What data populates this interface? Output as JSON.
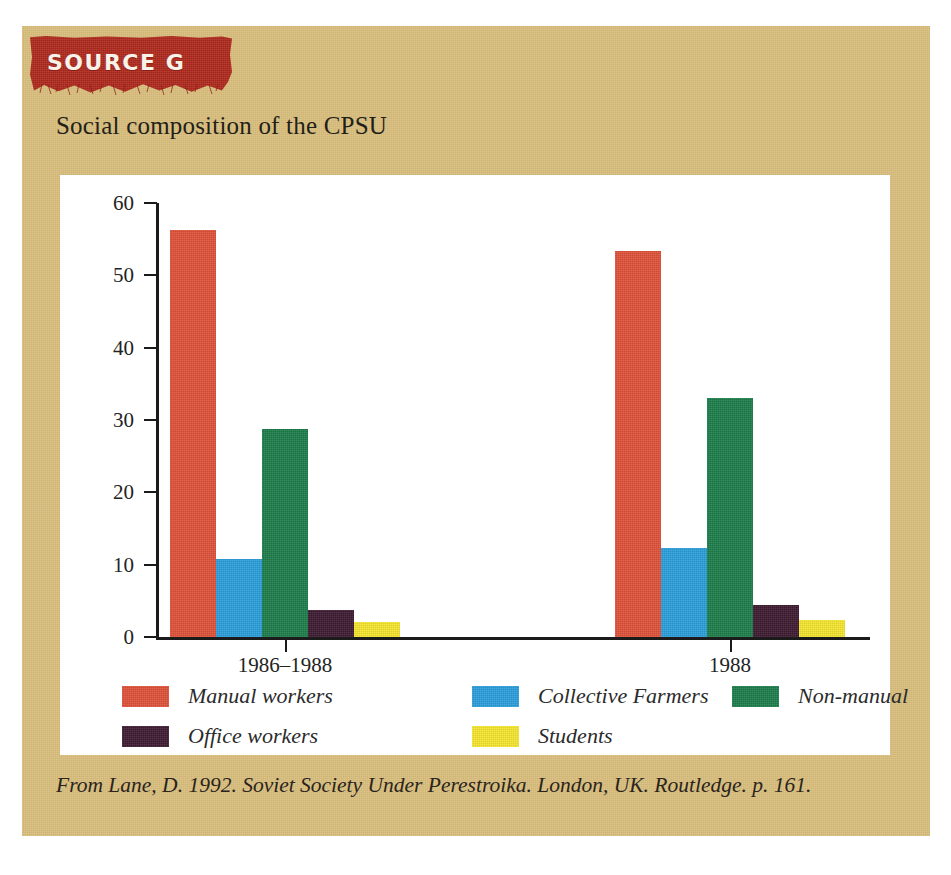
{
  "card": {
    "background_color": "#d8bd7c"
  },
  "banner": {
    "label": "SOURCE G",
    "color": "#b22a1e",
    "text_color": "#f7f3ea"
  },
  "title": "Social composition of the CPSU",
  "caption": "From Lane, D. 1992. Soviet Society Under Perestroika. London, UK. Routledge. p. 161.",
  "chart_data": {
    "type": "bar",
    "title": "Social composition of the CPSU",
    "xlabel": "",
    "ylabel": "",
    "categories": [
      "1986–1988",
      "1988"
    ],
    "ylim": [
      0,
      60
    ],
    "yticks": [
      0,
      10,
      20,
      30,
      40,
      50,
      60
    ],
    "grid": false,
    "legend_position": "bottom",
    "series": [
      {
        "name": "Manual workers",
        "color": "#df5138",
        "values": [
          56.3,
          53.3
        ]
      },
      {
        "name": "Collective Farmers",
        "color": "#2a9edb",
        "values": [
          10.8,
          12.3
        ]
      },
      {
        "name": "Non-manual",
        "color": "#1c7d4a",
        "values": [
          28.7,
          33.1
        ]
      },
      {
        "name": "Office workers",
        "color": "#3d1a30",
        "values": [
          3.8,
          4.4
        ]
      },
      {
        "name": "Students",
        "color": "#f5e62d",
        "values": [
          2.1,
          2.4
        ]
      }
    ]
  }
}
